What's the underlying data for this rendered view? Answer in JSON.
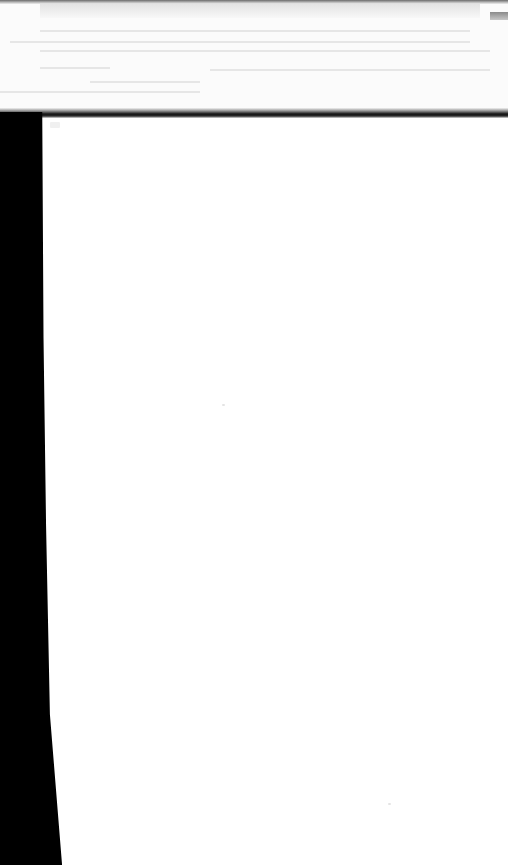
{
  "document": {
    "type": "scanned-page",
    "visible_text": [],
    "colors": {
      "paper": "#ffffff",
      "edge_shadow": "#000000",
      "bleed_through": "#e6e6e6"
    }
  }
}
